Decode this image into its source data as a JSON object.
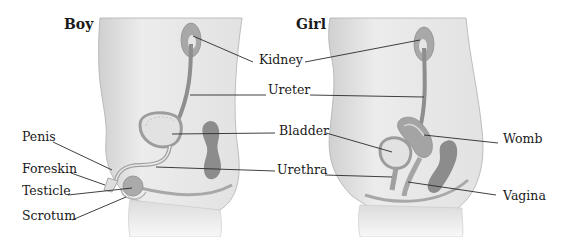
{
  "figure": {
    "panels": [
      {
        "id": "boy",
        "title": "Boy"
      },
      {
        "id": "girl",
        "title": "Girl"
      }
    ],
    "shared_labels": {
      "kidney": "Kidney",
      "ureter": "Ureter",
      "bladder": "Bladder",
      "urethra": "Urethra"
    },
    "boy_labels": {
      "penis": "Penis",
      "foreskin": "Foreskin",
      "testicle": "Testicle",
      "scrotum": "Scrotum"
    },
    "girl_labels": {
      "womb": "Womb",
      "vagina": "Vagina"
    },
    "colors": {
      "body_fill": "#e8e8e8",
      "body_outline": "#9a9a9a",
      "organ_dark": "#8c8c8c",
      "organ_mid": "#b4b4b4",
      "leader_line": "#2a2a2a"
    }
  }
}
